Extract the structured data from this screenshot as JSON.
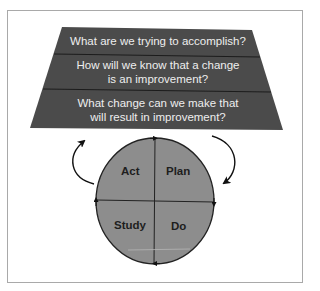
{
  "diagram": {
    "questions": [
      {
        "text": "What are we trying to accomplish?"
      },
      {
        "line1": "How will we know that a change",
        "line2": "is an improvement?"
      },
      {
        "line1": "What change can we make that",
        "line2": "will result in improvement?"
      }
    ],
    "cycle": {
      "quadrants": {
        "top_left": "Act",
        "top_right": "Plan",
        "bottom_left": "Study",
        "bottom_right": "Do"
      },
      "direction": "clockwise"
    },
    "colors": {
      "trapezoid_fill": "#4b4b4b",
      "divider": "#1c1c1c",
      "circle_fill": "#8d8d8d",
      "text_light": "#eeeeee",
      "frame_border": "#a9a9a9"
    }
  }
}
